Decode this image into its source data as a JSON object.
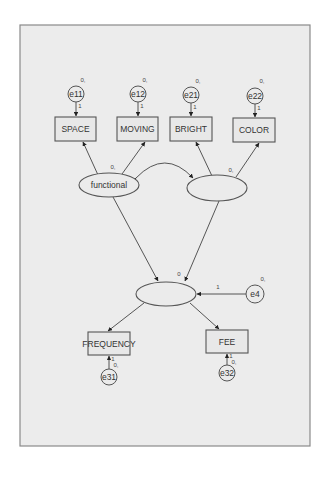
{
  "diagram": {
    "type": "structural-equation-model",
    "observed": {
      "space": {
        "label": "SPACE"
      },
      "moving": {
        "label": "MOVING"
      },
      "bright": {
        "label": "BRIGHT"
      },
      "color": {
        "label": "COLOR"
      },
      "frequency": {
        "label": "FREQUENCY"
      },
      "fee": {
        "label": "FEE"
      }
    },
    "latent": {
      "functional": {
        "label": "functional"
      },
      "second": {
        "label": ""
      },
      "outcome": {
        "label": ""
      }
    },
    "errors": {
      "e11": {
        "label": "e11",
        "mean": "0,",
        "weight": "1"
      },
      "e12": {
        "label": "e12",
        "mean": "0,",
        "weight": "1"
      },
      "e21": {
        "label": "e21",
        "mean": "0,",
        "weight": "1"
      },
      "e22": {
        "label": "e22",
        "mean": "0,",
        "weight": "1"
      },
      "e31": {
        "label": "e31",
        "mean": "0,",
        "weight": "1"
      },
      "e32": {
        "label": "e32",
        "mean": "0,",
        "weight": "1"
      },
      "e4": {
        "label": "e4",
        "mean": "0,",
        "weight": "1"
      }
    },
    "params": {
      "functional_mean": "0,",
      "second_mean": "0,",
      "outcome_intercept": "0"
    },
    "edges": [
      {
        "from": "e11",
        "to": "SPACE"
      },
      {
        "from": "e12",
        "to": "MOVING"
      },
      {
        "from": "e21",
        "to": "BRIGHT"
      },
      {
        "from": "e22",
        "to": "COLOR"
      },
      {
        "from": "functional",
        "to": "SPACE"
      },
      {
        "from": "functional",
        "to": "MOVING"
      },
      {
        "from": "second",
        "to": "BRIGHT"
      },
      {
        "from": "second",
        "to": "COLOR"
      },
      {
        "from": "functional",
        "to": "second",
        "type": "covariance"
      },
      {
        "from": "functional",
        "to": "outcome"
      },
      {
        "from": "second",
        "to": "outcome"
      },
      {
        "from": "e4",
        "to": "outcome"
      },
      {
        "from": "outcome",
        "to": "FREQUENCY"
      },
      {
        "from": "outcome",
        "to": "FEE"
      },
      {
        "from": "e31",
        "to": "FREQUENCY"
      },
      {
        "from": "e32",
        "to": "FEE"
      }
    ]
  }
}
